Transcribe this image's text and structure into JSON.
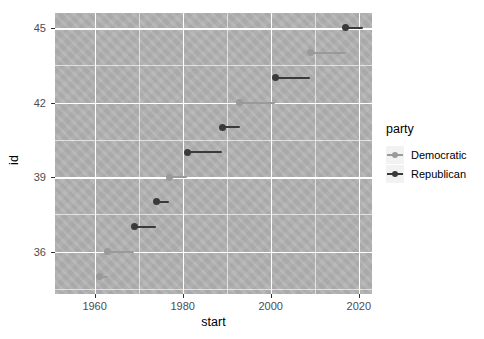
{
  "chart_data": {
    "type": "scatter",
    "title": "",
    "xlabel": "start",
    "ylabel": "id",
    "xlim": [
      1951,
      2023
    ],
    "ylim": [
      34.3,
      45.6
    ],
    "grid": true,
    "legend_position": "right",
    "legend_title": "party",
    "xticks": [
      1960,
      1980,
      2000,
      2020
    ],
    "yticks": [
      36,
      39,
      42,
      45
    ],
    "x_minor_ticks": [
      1950,
      1970,
      1990,
      2010
    ],
    "y_minor_ticks": [
      34.5,
      37.5,
      40.5,
      43.5
    ],
    "series": [
      {
        "name": "Democratic",
        "color": "#9a9a9a",
        "points": [
          {
            "id": 35,
            "start": 1961,
            "end": 1963
          },
          {
            "id": 36,
            "start": 1963,
            "end": 1969
          },
          {
            "id": 39,
            "start": 1977,
            "end": 1981
          },
          {
            "id": 42,
            "start": 1993,
            "end": 2001
          },
          {
            "id": 44,
            "start": 2009,
            "end": 2017
          }
        ]
      },
      {
        "name": "Republican",
        "color": "#3a3a3a",
        "points": [
          {
            "id": 34,
            "start": 1953,
            "end": 1961
          },
          {
            "id": 37,
            "start": 1969,
            "end": 1974
          },
          {
            "id": 38,
            "start": 1974,
            "end": 1977
          },
          {
            "id": 40,
            "start": 1981,
            "end": 1989
          },
          {
            "id": 41,
            "start": 1989,
            "end": 1993
          },
          {
            "id": 43,
            "start": 2001,
            "end": 2009
          },
          {
            "id": 45,
            "start": 2017,
            "end": 2021
          }
        ]
      }
    ]
  },
  "legend": {
    "title": "party",
    "entries": [
      {
        "label": "Democratic",
        "color": "#9a9a9a"
      },
      {
        "label": "Republican",
        "color": "#3a3a3a"
      }
    ]
  },
  "axes": {
    "x_title": "start",
    "y_title": "id",
    "x_tick_labels": [
      "1960",
      "1980",
      "2000",
      "2020"
    ],
    "y_tick_labels": [
      "36",
      "39",
      "42",
      "45"
    ]
  }
}
